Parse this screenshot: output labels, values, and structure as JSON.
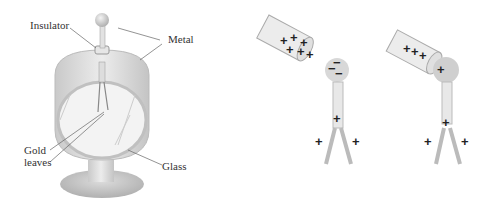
{
  "figure": {
    "left_panel": {
      "name": "electroscope",
      "labels": {
        "insulator": "Insulator",
        "metal": "Metal",
        "gold_leaves_line1": "Gold",
        "gold_leaves_line2": "leaves",
        "glass": "Glass"
      }
    },
    "middle_panel": {
      "rod_charges": [
        "+",
        "+",
        "+",
        "+",
        "+",
        "+",
        "+",
        "+"
      ],
      "knob_charges": [
        "−",
        "−",
        "−"
      ],
      "stem_charge": "+",
      "leaf_charges": [
        "+",
        "+"
      ]
    },
    "right_panel": {
      "rod_charges": [
        "+",
        "+",
        "+"
      ],
      "knob_charge": "+",
      "stem_charge": "+",
      "leaf_charges": [
        "+",
        "+"
      ]
    },
    "colors": {
      "metal": "#d8d8d8",
      "metal_dark": "#b5b5b5",
      "glass": "#eeeeee",
      "line": "#666666",
      "text": "#333333"
    }
  }
}
